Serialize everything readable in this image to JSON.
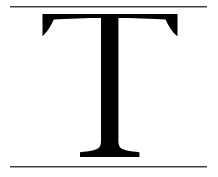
{
  "specimen": {
    "glyph_character": "T",
    "glyph_name": "latin-capital-letter-t",
    "glyph_color": "#000000",
    "background_color": "#ffffff",
    "canvas_width": 218,
    "canvas_height": 177,
    "style_description": "serif capital T with flared bracket serifs"
  },
  "guides": {
    "rule_color": "#3d3d3d",
    "top_rule": {
      "name": "cap-height-rule",
      "y": 6,
      "x_start": 10,
      "x_end": 207
    },
    "bottom_rule": {
      "name": "baseline-rule",
      "y": 166,
      "x_start": 10,
      "x_end": 207
    }
  },
  "metrics": {
    "arm_top_y": 14,
    "arm_left_x": 42,
    "arm_right_x": 178,
    "stem_left_x": 101,
    "stem_right_x": 118,
    "stem_center_x": 109.5,
    "foot_left_x": 80,
    "foot_right_x": 140,
    "foot_bottom_y": 157
  }
}
